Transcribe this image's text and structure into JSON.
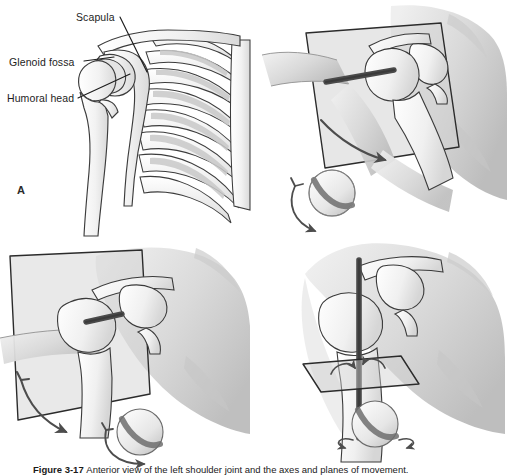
{
  "figure": {
    "label": "Figure 3-17",
    "caption_text": "Anterior view of the left shoulder joint and the axes and planes of movement.",
    "background_color": "#ffffff"
  },
  "palette": {
    "bone_fill": "#f4f4f4",
    "bone_outline": "#3a3a3a",
    "skin_shade": "#d8d8d8",
    "plane_fill": "#cfcfcf",
    "plane_outline": "#2b2b2b",
    "axis_pin": "#4a4a4a",
    "arrow": "#4d4d4d",
    "sphere_fill": "#ededed",
    "sphere_band": "#6f6f6f",
    "text": "#1a1a1a"
  },
  "panels": [
    {
      "id": "A",
      "letter": "A",
      "title": "Bony anatomy of the shoulder girdle and thorax",
      "view": "anterior skeletal view",
      "annotations": [
        {
          "name": "scapula",
          "label": "Scapula"
        },
        {
          "name": "glenoid-fossa",
          "label": "Glenoid fossa"
        },
        {
          "name": "humoral-head",
          "label": "Humoral head"
        }
      ],
      "structures": [
        "clavicle",
        "scapula",
        "humerus",
        "ribs",
        "sternum"
      ]
    },
    {
      "id": "B",
      "letter": "B",
      "title": "Abduction and adduction in the frontal plane",
      "plane": "frontal (coronal) plane",
      "axis": "anteroposterior axis",
      "motion": "abduction / adduction",
      "sphere": {
        "band": "diagonal",
        "arrow": "double curved arc"
      }
    },
    {
      "id": "C",
      "letter": "C",
      "title": "Flexion and extension in the sagittal plane",
      "plane": "sagittal plane",
      "axis": "mediolateral axis",
      "motion": "flexion / extension",
      "sphere": {
        "band": "diagonal",
        "arrow": "double curved arc"
      }
    },
    {
      "id": "D",
      "letter": "D",
      "title": "Internal and external rotation in the transverse plane",
      "plane": "transverse (horizontal) plane",
      "axis": "vertical (longitudinal) axis",
      "motion": "internal / external rotation",
      "sphere": {
        "band": "diagonal",
        "arrow": "horizontal ellipse arrows"
      }
    }
  ]
}
